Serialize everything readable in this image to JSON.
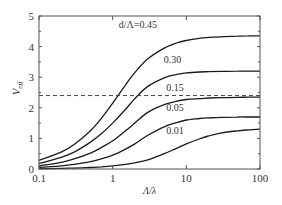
{
  "chart_data": {
    "type": "line",
    "title": "",
    "xlabel": "Λ/λ",
    "ylabel": "V_eff",
    "xscale": "log",
    "xlim": [
      0.1,
      100
    ],
    "ylim": [
      0,
      5
    ],
    "xticks": [
      0.1,
      1,
      10,
      100
    ],
    "xtick_labels": [
      "0.1",
      "1",
      "10",
      "100"
    ],
    "yticks": [
      0,
      1,
      2,
      3,
      4,
      5
    ],
    "ytick_labels": [
      "0",
      "1",
      "2",
      "3",
      "4",
      "5"
    ],
    "grid": false,
    "legend": "inline curve labels",
    "x": [
      0.1,
      0.2,
      0.3,
      0.5,
      0.7,
      1,
      1.5,
      2,
      3,
      5,
      7,
      10,
      15,
      20,
      30,
      50,
      70,
      100
    ],
    "series": [
      {
        "name": "d/Λ=0.45",
        "label": "d/Λ=0.45",
        "label_pos": [
          2.2,
          4.6
        ],
        "values": [
          0.28,
          0.55,
          0.8,
          1.25,
          1.65,
          2.15,
          2.75,
          3.15,
          3.6,
          3.95,
          4.1,
          4.2,
          4.27,
          4.3,
          4.32,
          4.34,
          4.35,
          4.35
        ]
      },
      {
        "name": "0.30",
        "label": "0.30",
        "label_pos": [
          6.5,
          3.45
        ],
        "values": [
          0.18,
          0.38,
          0.55,
          0.88,
          1.15,
          1.5,
          1.95,
          2.3,
          2.7,
          2.98,
          3.08,
          3.14,
          3.17,
          3.18,
          3.19,
          3.2,
          3.2,
          3.2
        ]
      },
      {
        "name": "0.15",
        "label": "0.15",
        "label_pos": [
          7,
          2.55
        ],
        "values": [
          0.1,
          0.22,
          0.33,
          0.52,
          0.7,
          0.92,
          1.25,
          1.5,
          1.85,
          2.1,
          2.2,
          2.27,
          2.3,
          2.32,
          2.33,
          2.34,
          2.35,
          2.35
        ]
      },
      {
        "name": "0.05",
        "label": "0.05",
        "label_pos": [
          7,
          1.9
        ],
        "values": [
          0.05,
          0.1,
          0.15,
          0.24,
          0.33,
          0.45,
          0.65,
          0.82,
          1.1,
          1.38,
          1.5,
          1.6,
          1.65,
          1.67,
          1.69,
          1.7,
          1.7,
          1.7
        ]
      },
      {
        "name": "0.01",
        "label": "0.01",
        "label_pos": [
          7,
          1.15
        ],
        "values": [
          0.01,
          0.02,
          0.03,
          0.05,
          0.07,
          0.1,
          0.15,
          0.2,
          0.3,
          0.5,
          0.65,
          0.82,
          0.98,
          1.08,
          1.18,
          1.25,
          1.28,
          1.3
        ]
      }
    ],
    "reference_lines": [
      {
        "type": "horizontal",
        "y": 2.4,
        "style": "dashed"
      }
    ]
  },
  "colors": {
    "line": "#1a1a1a",
    "axis": "#555555",
    "dashed": "#444444"
  }
}
